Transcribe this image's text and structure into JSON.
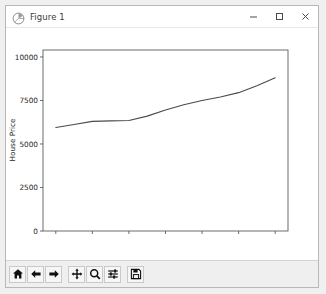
{
  "window": {
    "title": "Figure 1",
    "app_icon": "matplotlib-icon",
    "controls": {
      "minimize": "minimize-button",
      "maximize": "maximize-button",
      "close": "close-button"
    }
  },
  "toolbar": {
    "buttons": [
      {
        "name": "home-button",
        "icon": "home-icon",
        "tooltip": "Reset original view"
      },
      {
        "name": "back-button",
        "icon": "arrow-left-icon",
        "tooltip": "Back to previous view"
      },
      {
        "name": "forward-button",
        "icon": "arrow-right-icon",
        "tooltip": "Forward to next view"
      },
      {
        "name": "pan-button",
        "icon": "move-cross-icon",
        "tooltip": "Pan axes with left mouse, zoom with right"
      },
      {
        "name": "zoom-button",
        "icon": "magnifier-icon",
        "tooltip": "Zoom to rectangle"
      },
      {
        "name": "configure-subplots-button",
        "icon": "sliders-icon",
        "tooltip": "Configure subplots"
      },
      {
        "name": "save-button",
        "icon": "floppy-disk-icon",
        "tooltip": "Save the figure"
      }
    ]
  },
  "chart_data": {
    "type": "line",
    "title": "",
    "xlabel": "",
    "ylabel": "House Price",
    "xlim": [
      2011.65,
      2018.35
    ],
    "ylim": [
      0,
      10400
    ],
    "xticks": [
      2012,
      2013,
      2014,
      2015,
      2016,
      2017,
      2018
    ],
    "xticklabels": [
      "2012",
      "2013",
      "2014",
      "2015",
      "2016",
      "2017",
      "2018"
    ],
    "yticks": [
      0,
      2500,
      5000,
      7500,
      10000
    ],
    "yticklabels": [
      "0",
      "2500",
      "5000",
      "7500",
      "10000"
    ],
    "grid": false,
    "legend": null,
    "line_color": "#4a4a4a",
    "series": [
      {
        "name": "House Price",
        "x": [
          2012,
          2012.5,
          2013,
          2013.5,
          2014,
          2014.5,
          2015,
          2015.5,
          2016,
          2016.5,
          2017,
          2017.5,
          2018
        ],
        "values": [
          5950,
          6120,
          6300,
          6330,
          6350,
          6600,
          6950,
          7250,
          7500,
          7700,
          7950,
          8350,
          8800
        ]
      }
    ]
  }
}
